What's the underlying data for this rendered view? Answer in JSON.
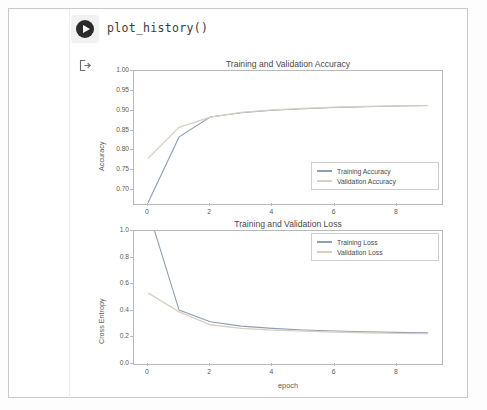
{
  "notebook": {
    "run_button_icon": "play-circle-icon",
    "output_marker_icon": "output-arrow-icon",
    "cell_code": "plot_history()"
  },
  "colors": {
    "training": "#8d9fb5",
    "validation": "#d9cfc2",
    "axis": "#b9b9b9",
    "text": "#4a4a4a",
    "frame": "#c9c9c9"
  },
  "chart_data": [
    {
      "type": "line",
      "title": "Training and Validation Accuracy",
      "xlabel": "",
      "ylabel": "Accuracy",
      "xlim": [
        -0.45,
        9.45
      ],
      "ylim": [
        0.665,
        1.0
      ],
      "xticks": [
        "0",
        "2",
        "4",
        "6",
        "8"
      ],
      "xtick_values": [
        0,
        2,
        4,
        6,
        8
      ],
      "yticks": [
        "0.70",
        "0.75",
        "0.80",
        "0.85",
        "0.90",
        "0.95",
        "1.00"
      ],
      "ytick_values": [
        0.7,
        0.75,
        0.8,
        0.85,
        0.9,
        0.95,
        1.0
      ],
      "grid": false,
      "legend_position": "lower right",
      "x": [
        0,
        1,
        2,
        3,
        4,
        5,
        6,
        7,
        8,
        9
      ],
      "series": [
        {
          "name": "Training Accuracy",
          "color": "#8d9fb5",
          "values": [
            0.668,
            0.834,
            0.884,
            0.895,
            0.901,
            0.905,
            0.908,
            0.91,
            0.912,
            0.913
          ]
        },
        {
          "name": "Validation Accuracy",
          "color": "#d9cfc2",
          "values": [
            0.78,
            0.858,
            0.884,
            0.896,
            0.902,
            0.906,
            0.909,
            0.911,
            0.912,
            0.913
          ]
        }
      ]
    },
    {
      "type": "line",
      "title": "Training and Validation Loss",
      "xlabel": "epoch",
      "ylabel": "Cross Entropy",
      "xlim": [
        -0.45,
        9.45
      ],
      "ylim": [
        0.0,
        1.0
      ],
      "xticks": [
        "0",
        "2",
        "4",
        "6",
        "8"
      ],
      "xtick_values": [
        0,
        2,
        4,
        6,
        8
      ],
      "yticks": [
        "0.0",
        "0.2",
        "0.4",
        "0.6",
        "0.8",
        "1.0"
      ],
      "ytick_values": [
        0.0,
        0.2,
        0.4,
        0.6,
        0.8,
        1.0
      ],
      "grid": false,
      "legend_position": "upper right",
      "x": [
        0,
        1,
        2,
        3,
        4,
        5,
        6,
        7,
        8,
        9
      ],
      "series": [
        {
          "name": "Training Loss",
          "color": "#8d9fb5",
          "values": [
            1.16,
            0.405,
            0.318,
            0.285,
            0.268,
            0.256,
            0.248,
            0.242,
            0.238,
            0.235
          ]
        },
        {
          "name": "Validation Loss",
          "color": "#d9cfc2",
          "values": [
            0.535,
            0.392,
            0.295,
            0.268,
            0.255,
            0.247,
            0.24,
            0.235,
            0.231,
            0.228
          ]
        }
      ]
    }
  ]
}
